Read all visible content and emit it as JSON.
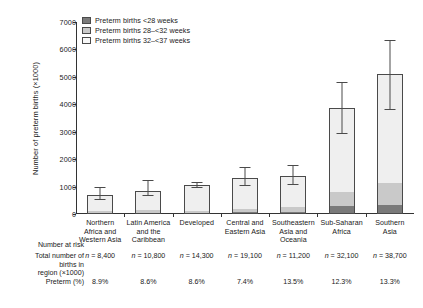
{
  "chart_data": {
    "type": "bar",
    "subtype": "stacked-bar-with-error-bars",
    "title": "",
    "xlabel": "",
    "ylabel": "Number of preterm births (×1000)",
    "ylim": [
      0,
      7000
    ],
    "ytick_step": 1000,
    "yticks": [
      "0",
      "1000",
      "2000",
      "3000",
      "4000",
      "5000",
      "6000",
      "7000"
    ],
    "grid": false,
    "legend_position": "top-left",
    "categories": [
      "Northern Africa and Western Asia",
      "Latin America and the Caribbean",
      "Developed",
      "Central and Eastern Asia",
      "Southeastern Asia and Oceania",
      "Sub-Saharan Africa",
      "Southern Asia"
    ],
    "category_lines": [
      [
        "Northern",
        "Africa and",
        "Western Asia"
      ],
      [
        "Latin America",
        "and the",
        "Caribbean"
      ],
      [
        "Developed"
      ],
      [
        "Central and",
        "Eastern Asia"
      ],
      [
        "Southeastern",
        "Asia and",
        "Oceania"
      ],
      [
        "Sub-Saharan",
        "Africa"
      ],
      [
        "Southern",
        "Asia"
      ]
    ],
    "series": [
      {
        "name": "Preterm births <28 weeks",
        "color": "#7a7a7a",
        "values": [
          40,
          50,
          30,
          70,
          90,
          290,
          330
        ]
      },
      {
        "name": "Preterm births 28–<32 weeks",
        "color": "#c9c9c9",
        "values": [
          70,
          90,
          60,
          130,
          160,
          530,
          790
        ]
      },
      {
        "name": "Preterm births 32–<37 weeks",
        "color": "#efefef",
        "values": [
          600,
          710,
          960,
          1100,
          1150,
          3040,
          3990
        ]
      }
    ],
    "totals": [
      710,
      850,
      1050,
      1300,
      1400,
      3860,
      5110
    ],
    "error_bars": [
      {
        "low": 560,
        "high": 980
      },
      {
        "low": 700,
        "high": 1230
      },
      {
        "low": 980,
        "high": 1160
      },
      {
        "low": 1070,
        "high": 1700
      },
      {
        "low": 1110,
        "high": 1790
      },
      {
        "low": 2960,
        "high": 4820
      },
      {
        "low": 3840,
        "high": 6360
      }
    ]
  },
  "legend": {
    "items": [
      {
        "label": "Preterm births <28 weeks"
      },
      {
        "label": "Preterm births 28–<32 weeks"
      },
      {
        "label": "Preterm births 32–<37 weeks"
      }
    ]
  },
  "axis": {
    "ylabel": "Number of preterm births (×1000)"
  },
  "table": {
    "section_title": "Number at risk",
    "rows": [
      {
        "header": "Total number of\nbirths in\nregion (×1000)",
        "values": [
          "n = 8,400",
          "n = 10,800",
          "n = 14,300",
          "n = 19,100",
          "n = 11,200",
          "n = 32,100",
          "n = 38,700"
        ]
      },
      {
        "header": "Preterm (%)",
        "values": [
          "8.9%",
          "8.6%",
          "8.6%",
          "7.4%",
          "13.5%",
          "12.3%",
          "13.3%"
        ]
      }
    ]
  }
}
